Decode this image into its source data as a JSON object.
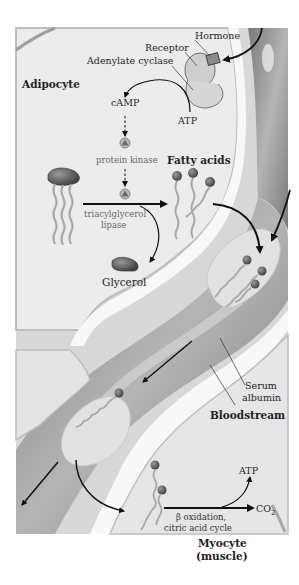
{
  "figure": {
    "compartments": {
      "adipocyte": "Adipocyte",
      "bloodstream": "Bloodstream",
      "myocyte_line1": "Myocyte",
      "myocyte_line2": "(muscle)"
    },
    "labels": {
      "hormone": "Hormone",
      "receptor": "Receptor",
      "adenylate_cyclase": "Adenylate cyclase",
      "atp_adipocyte": "ATP",
      "camp": "cAMP",
      "protein_kinase": "protein kinase",
      "fatty_acids": "Fatty acids",
      "lipase_line1": "triacylglycerol",
      "lipase_line2": "lipase",
      "glycerol": "Glycerol",
      "serum_line1": "Serum",
      "serum_line2": "albumin",
      "beta_ox_line1": "β oxidation,",
      "beta_ox_line2": "citric acid cycle",
      "atp_myocyte": "ATP",
      "co2_main": "CO",
      "co2_sub": "2"
    },
    "colors": {
      "cell_fill": "#e9e9e9",
      "cell_edge": "#bdbdbd",
      "vessel_fill": "#8e8e8e",
      "vessel_light": "#b8b8b8",
      "albumin_fill": "#dcdcdc",
      "head_fill": "#555555",
      "tail_stroke": "#a8a8a8",
      "arrow": "#111111",
      "enzyme_fill": "#9a9a9a"
    }
  }
}
